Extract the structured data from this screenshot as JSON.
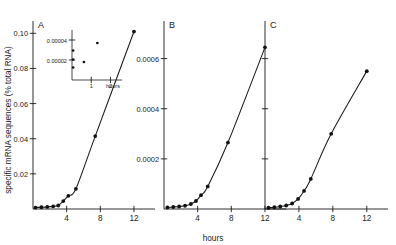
{
  "figure": {
    "ylabel": "specific  mRNA  sequences  (% total RNA)",
    "xlabel": "hours",
    "panel_labels": [
      "A",
      "B",
      "C"
    ]
  },
  "inset": {
    "panel": "A",
    "xlabel": "hours",
    "yticks": [
      "0.00004",
      "0.00002"
    ],
    "xticks": [
      "1",
      "2"
    ]
  },
  "chart_data": [
    {
      "type": "line",
      "title": "A",
      "xlabel": "hours",
      "ylabel": "specific mRNA sequences (% total RNA)",
      "xlim": [
        0,
        14.5
      ],
      "ylim": [
        0,
        0.107
      ],
      "xticks": [
        4,
        8,
        12
      ],
      "xticklabels": [
        "4",
        "8",
        "12"
      ],
      "yticks": [
        0.02,
        0.04,
        0.06,
        0.08,
        0.1
      ],
      "yticklabels": [
        "0.02",
        "0.04",
        "0.06",
        "0.08",
        "0.10"
      ],
      "grid": false,
      "legend": false,
      "marker": "filled-circle",
      "x": [
        0.3,
        1.0,
        1.7,
        2.4,
        3.0,
        3.6,
        4.2,
        5.1,
        7.4,
        12.0
      ],
      "y": [
        0.0008,
        0.001,
        0.0012,
        0.0015,
        0.002,
        0.0045,
        0.0075,
        0.0115,
        0.0415,
        0.101
      ]
    },
    {
      "type": "line",
      "title": "B",
      "xlabel": "hours",
      "xlim": [
        0,
        14.5
      ],
      "ylim": [
        0,
        0.00075
      ],
      "xticks": [
        4,
        8,
        12
      ],
      "xticklabels": [
        "4",
        "8",
        "12"
      ],
      "yticks": [
        0.0002,
        0.0004,
        0.0006
      ],
      "yticklabels": [
        "0.0002",
        "0.0004",
        "0.0006"
      ],
      "grid": false,
      "legend": false,
      "marker": "filled-circle",
      "x": [
        0.4,
        1.1,
        1.8,
        2.5,
        3.2,
        3.8,
        4.4,
        5.2,
        7.6,
        12.0
      ],
      "y": [
        6e-06,
        8e-06,
        1e-05,
        1.3e-05,
        2e-05,
        3.2e-05,
        5.5e-05,
        9e-05,
        0.000265,
        0.000645
      ]
    },
    {
      "type": "line",
      "title": "C",
      "xlabel": "hours",
      "xlim": [
        0,
        14.5
      ],
      "ylim": [
        0,
        0.00075
      ],
      "xticks": [
        4,
        8,
        12
      ],
      "xticklabels": [
        "4",
        "8",
        "12"
      ],
      "yticks": [
        0.0002,
        0.0004,
        0.0006
      ],
      "yticklabels": [
        "",
        "",
        ""
      ],
      "grid": false,
      "legend": false,
      "marker": "filled-circle",
      "x": [
        0.4,
        1.1,
        1.8,
        2.5,
        3.2,
        3.9,
        4.6,
        5.4,
        7.8,
        12.0
      ],
      "y": [
        5e-06,
        7e-06,
        1e-05,
        1.4e-05,
        2.2e-05,
        4e-05,
        7.2e-05,
        0.00012,
        0.0003,
        0.00055
      ]
    },
    {
      "type": "scatter",
      "title": "A-inset",
      "xlabel": "hours",
      "xlim": [
        0,
        2.6
      ],
      "ylim": [
        0,
        5e-05
      ],
      "xticks": [
        1,
        2
      ],
      "xticklabels": [
        "1",
        "2"
      ],
      "yticks": [
        2e-05,
        4e-05
      ],
      "yticklabels": [
        "0.00002",
        "0.00004"
      ],
      "grid": false,
      "legend": false,
      "marker": "filled-circle",
      "x": [
        0.06,
        0.06,
        0.06,
        0.62,
        1.32
      ],
      "y": [
        1.25e-05,
        2.05e-05,
        2.95e-05,
        1.8e-05,
        3.7e-05
      ]
    }
  ]
}
